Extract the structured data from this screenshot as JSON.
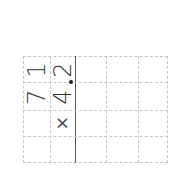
{
  "worksheet": {
    "description": "Vertical multiplication written on a grid, rotated 90 degrees",
    "multiplicand_digits": [
      "7",
      "1"
    ],
    "multiplier_digits": [
      "4",
      "2"
    ],
    "decimal_point": ".",
    "operator": "×",
    "grid": {
      "rows": 4,
      "columns": 5
    }
  }
}
